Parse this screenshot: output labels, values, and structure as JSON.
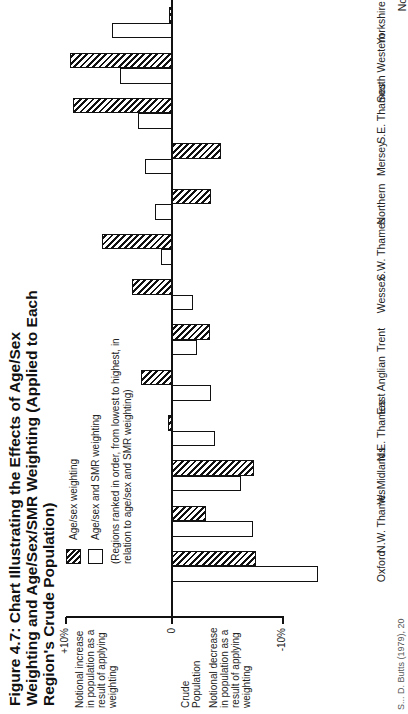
{
  "figure": {
    "title": "Figure 4.7:  Chart Illustrating the Effects of Age/Sex Weighting and Age/Sex/SMR Weighting (Applied to Each Region's Crude Population)",
    "orientation": "rotated 90 degrees counter-clockwise on page",
    "source_note": "S... D. Butts (1979), 20"
  },
  "legend": {
    "items": [
      {
        "label": "Age/sex weighting",
        "style": "hatched"
      },
      {
        "label": "Age/sex and SMR weighting",
        "style": "open"
      }
    ],
    "note": "(Regions ranked in order, from lowest to highest, in relation to age/sex and SMR weighting)"
  },
  "axis": {
    "tick_top": "+10%",
    "tick_zero": "0",
    "tick_bottom": "-10%",
    "increase_label": "Notional increase in population as a result of applying weighting",
    "zero_label": "Crude Population",
    "decrease_label": "Notional decrease in population as a result of applying weighting"
  },
  "chart_data": {
    "type": "bar",
    "title": "Chart Illustrating the Effects of Age/Sex Weighting and Age/Sex/SMR Weighting (Applied to Each Region's Crude Population)",
    "xlabel": "Region",
    "ylabel": "Notional change in population as a result of applying weighting (%)",
    "ylim": [
      -14,
      10
    ],
    "grid": false,
    "legend_position": "top-left (rotated)",
    "categories": [
      "Oxford",
      "N.W. Thames",
      "W. Midlands",
      "N.E. Thames",
      "East Anglian",
      "Trent",
      "Wessex",
      "S.W. Thames",
      "Northern",
      "Mersey",
      "S.E. Thames",
      "South Western",
      "Yorkshire",
      "North Western"
    ],
    "series": [
      {
        "name": "Age/sex weighting",
        "values": [
          -7.7,
          -3.1,
          -7.5,
          0.4,
          2.8,
          -3.5,
          3.7,
          6.4,
          -3.6,
          -4.5,
          9.1,
          9.4,
          0.3,
          0.2
        ]
      },
      {
        "name": "Age/sex and SMR weighting",
        "values": [
          -13.4,
          -7.4,
          -6.3,
          -3.9,
          -3.6,
          -2.3,
          -1.9,
          1.0,
          1.6,
          2.5,
          3.1,
          4.8,
          5.5,
          10.0
        ]
      }
    ]
  }
}
